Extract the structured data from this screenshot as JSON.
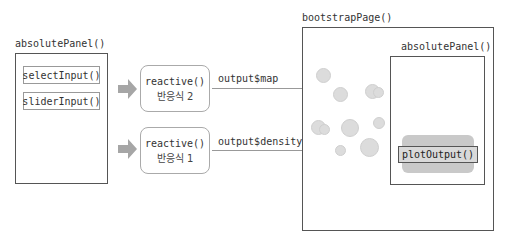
{
  "left_panel": {
    "title": "absolutePanel()",
    "inputs": [
      {
        "label": "selectInput()"
      },
      {
        "label": "sliderInput()"
      }
    ]
  },
  "reactives": [
    {
      "func": "reactive()",
      "label": "반응식 2",
      "output": "output$map"
    },
    {
      "func": "reactive()",
      "label": "반응식 1",
      "output": "output$density"
    }
  ],
  "right_page": {
    "title": "bootstrapPage()",
    "inner_panel": {
      "title": "absolutePanel()",
      "plot": {
        "label": "plotOutput()"
      }
    }
  },
  "colors": {
    "arrow_fill": "#a6a6a6",
    "circle_fill": "#dcdcdc",
    "plot_bg": "#c9c9c9",
    "border": "#555555"
  }
}
